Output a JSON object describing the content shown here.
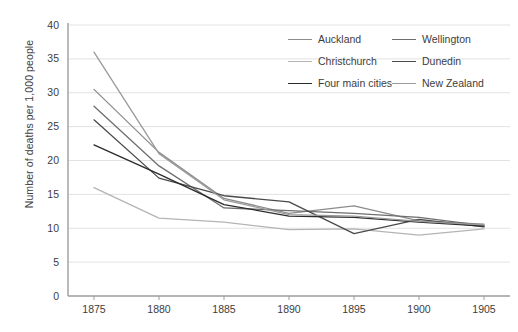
{
  "chart_data": {
    "type": "line",
    "title": "",
    "xlabel": "",
    "ylabel": "Number of deaths per 1,000 people",
    "x": [
      1875,
      1880,
      1885,
      1890,
      1895,
      1900,
      1905
    ],
    "xlim": [
      1873,
      1907
    ],
    "ylim": [
      0,
      40
    ],
    "xticks": [
      "1875",
      "1880",
      "1885",
      "1890",
      "1895",
      "1900",
      "1905"
    ],
    "yticks": [
      "0",
      "5",
      "10",
      "15",
      "20",
      "25",
      "30",
      "35",
      "40"
    ],
    "grid": true,
    "legend_position": "top-right",
    "series": [
      {
        "name": "Auckland",
        "color": "#8c8c8c",
        "values": [
          30.5,
          21.2,
          14.4,
          12.2,
          13.3,
          11.1,
          10.6
        ]
      },
      {
        "name": "Wellington",
        "color": "#6e6e6e",
        "values": [
          28.0,
          19.2,
          13.0,
          12.6,
          12.2,
          11.6,
          10.4
        ]
      },
      {
        "name": "Christchurch",
        "color": "#b4b4b4",
        "values": [
          16.0,
          11.5,
          10.9,
          9.8,
          9.9,
          9.0,
          9.9
        ]
      },
      {
        "name": "Dunedin",
        "color": "#4a4a4a",
        "values": [
          26.0,
          17.4,
          14.8,
          13.9,
          9.2,
          11.3,
          10.2
        ]
      },
      {
        "name": "Four main cities",
        "color": "#2b2b2b",
        "values": [
          22.3,
          18.0,
          13.5,
          11.8,
          11.6,
          10.9,
          10.3
        ]
      },
      {
        "name": "New Zealand",
        "color": "#9a9a9a",
        "values": [
          36.0,
          21.0,
          14.2,
          12.0,
          11.8,
          11.0,
          10.5
        ]
      }
    ]
  },
  "legend": {
    "items": [
      {
        "label": "Auckland",
        "color": "#8c8c8c"
      },
      {
        "label": "Wellington",
        "color": "#6e6e6e"
      },
      {
        "label": "Christchurch",
        "color": "#b4b4b4"
      },
      {
        "label": "Dunedin",
        "color": "#4a4a4a"
      },
      {
        "label": "Four main cities",
        "color": "#2b2b2b"
      },
      {
        "label": "New Zealand",
        "color": "#9a9a9a"
      }
    ],
    "order": [
      0,
      1,
      2,
      3,
      4,
      5
    ]
  },
  "axes": {
    "y_label": "Number of deaths per 1,000 people",
    "axis_color": "#9d9d9d",
    "grid_color": "#e2e2e2",
    "text_color": "#3d3d3d"
  }
}
